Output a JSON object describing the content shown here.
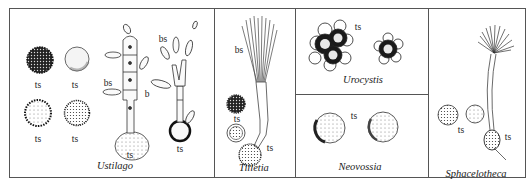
{
  "figure": {
    "panels": [
      {
        "id": "ustilago",
        "title": "Ustilago",
        "labels": {
          "ts1": "ts",
          "ts2": "ts",
          "ts3": "ts",
          "ts4": "ts",
          "ts5": "ts",
          "ts6": "ts",
          "bs1": "bs",
          "b": "b",
          "bs2": "bs"
        }
      },
      {
        "id": "tilletia",
        "title": "Tilletia",
        "labels": {
          "bs": "bs",
          "ts1": "ts",
          "ts2": "ts"
        }
      },
      {
        "id": "urocystis",
        "title": "Urocystis",
        "labels": {
          "ts": "ts"
        }
      },
      {
        "id": "neovossia",
        "title": "Neovossia",
        "labels": {
          "ts": "ts"
        }
      },
      {
        "id": "sphacelotheca",
        "title": "Sphacelotheca",
        "labels": {
          "ts1": "ts",
          "ts2": "ts"
        }
      }
    ],
    "legend_abbreviations": {
      "ts": "teliospore",
      "bs": "basidiospore",
      "b": "basidium"
    }
  }
}
